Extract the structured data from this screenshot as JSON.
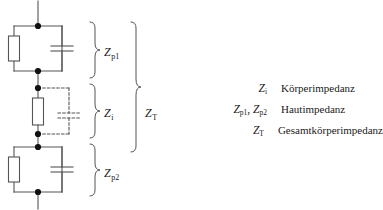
{
  "diagram": {
    "stroke_color": "#555555",
    "node_color": "#111111",
    "background": "#ffffff",
    "braces": [
      {
        "name": "z-p1",
        "symbol": "Z",
        "subscript": "p1"
      },
      {
        "name": "z-i",
        "symbol": "Z",
        "subscript": "i"
      },
      {
        "name": "z-p2",
        "symbol": "Z",
        "subscript": "p2"
      },
      {
        "name": "z-t",
        "symbol": "Z",
        "subscript": "T"
      }
    ],
    "blocks": [
      {
        "name": "skin-impedance-top",
        "style": "solid",
        "components": [
          "resistor",
          "capacitor"
        ]
      },
      {
        "name": "body-impedance-middle",
        "style": "mixed",
        "components": [
          "resistor",
          "capacitor-dashed"
        ]
      },
      {
        "name": "skin-impedance-bottom",
        "style": "solid",
        "components": [
          "resistor",
          "capacitor"
        ]
      }
    ]
  },
  "legend": {
    "rows": [
      {
        "symbol": "Z",
        "subscript": "i",
        "symbol_text": "Z",
        "description": "Körperimpedanz"
      },
      {
        "symbol": "Z",
        "subscript": "p1, p2",
        "symbol_text": "Z",
        "description": "Hautimpedanz"
      },
      {
        "symbol": "Z",
        "subscript": "T",
        "symbol_text": "Z",
        "description": "Gesamtkörperimpedanz"
      }
    ],
    "row0_sym_main": "Z",
    "row0_sym_sub": "i",
    "row1_sym_a_main": "Z",
    "row1_sym_a_sub": "p1",
    "row1_sep": ", ",
    "row1_sym_b_main": "Z",
    "row1_sym_b_sub": "p2",
    "row2_sym_main": "Z",
    "row2_sym_sub": "T",
    "desc0": "Körperimpedanz",
    "desc1": "Hautimpedanz",
    "desc2": "Gesamtkörperimpedanz"
  },
  "labels": {
    "zp1_main": "Z",
    "zp1_sub": "p1",
    "zi_main": "Z",
    "zi_sub": "i",
    "zp2_main": "Z",
    "zp2_sub": "p2",
    "zt_main": "Z",
    "zt_sub": "T"
  }
}
